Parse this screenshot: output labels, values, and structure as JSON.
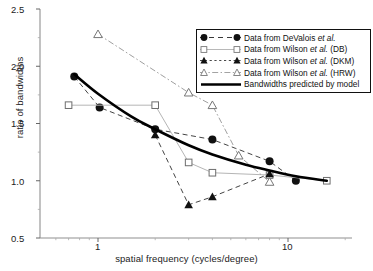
{
  "chart_data": {
    "type": "scatter",
    "title": "",
    "xlabel": "spatial frequency (cycles/degree)",
    "ylabel": "ratio of bandwidths",
    "xscale": "log",
    "xlim": [
      0.55,
      18
    ],
    "ylim": [
      0.5,
      2.5
    ],
    "xticks": [
      1,
      10
    ],
    "xticklabels": [
      "1",
      "10"
    ],
    "yticks": [
      0.5,
      1.0,
      1.5,
      2.0,
      2.5
    ],
    "yticklabels": [
      "0.5",
      "1.0",
      "1.5",
      "2.0",
      "2.5"
    ],
    "grid": false,
    "legend_position": "upper right",
    "series": [
      {
        "name": "Data from DeValois et al.",
        "marker": "filled-circle",
        "line": "dashed",
        "color": "#111111",
        "x": [
          0.75,
          1.02,
          2.0,
          4.0,
          8.0,
          11.0
        ],
        "y": [
          1.91,
          1.64,
          1.45,
          1.36,
          1.17,
          1.0
        ]
      },
      {
        "name": "Data from Wilson et al. (DB)",
        "marker": "open-square",
        "line": "solid-light",
        "color": "#9a9a9a",
        "x": [
          0.7,
          2.0,
          3.0,
          4.0,
          8.0,
          16.0
        ],
        "y": [
          1.66,
          1.66,
          1.16,
          1.07,
          1.05,
          1.0
        ]
      },
      {
        "name": "Data from Wilson et al. (DKM)",
        "marker": "filled-triangle",
        "line": "dashed",
        "color": "#111111",
        "x": [
          2.0,
          3.0,
          4.0,
          8.0
        ],
        "y": [
          1.4,
          0.79,
          0.86,
          1.06
        ]
      },
      {
        "name": "Data from Wilson et al. (HRW)",
        "marker": "open-triangle",
        "line": "dash-dot",
        "color": "#8a8a8a",
        "x": [
          1.0,
          3.0,
          4.0,
          5.5,
          8.0
        ],
        "y": [
          2.28,
          1.77,
          1.66,
          1.22,
          0.99
        ]
      },
      {
        "name": "Bandwidths predicted by model",
        "marker": "none",
        "line": "solid-thick",
        "color": "#000000",
        "x": [
          0.75,
          1.0,
          1.5,
          2.0,
          3.0,
          4.0,
          6.0,
          8.0,
          11.0,
          16.0
        ],
        "y": [
          1.93,
          1.76,
          1.56,
          1.45,
          1.31,
          1.23,
          1.14,
          1.09,
          1.04,
          1.0
        ]
      }
    ]
  },
  "axes": {
    "ylabel": "ratio of bandwidths",
    "xlabel": "spatial frequency (cycles/degree)",
    "ytick_0": "2.5",
    "ytick_1": "2.0",
    "ytick_2": "1.5",
    "ytick_3": "1.0",
    "ytick_4": "0.5",
    "xtick_0": "1",
    "xtick_1": "10"
  },
  "legend": {
    "items": [
      {
        "pre": "Data from DeValois ",
        "ital": "et al.",
        "post": "",
        "marker": "filled-circle"
      },
      {
        "pre": "Data from Wilson ",
        "ital": "et al.",
        "post": " (DB)",
        "marker": "open-square"
      },
      {
        "pre": "Data from Wilson ",
        "ital": "et al.",
        "post": " (DKM)",
        "marker": "filled-triangle"
      },
      {
        "pre": "Data from Wilson ",
        "ital": "et al.",
        "post": " (HRW)",
        "marker": "open-triangle"
      },
      {
        "pre": "Bandwidths predicted by model",
        "ital": "",
        "post": "",
        "marker": "line"
      }
    ]
  }
}
